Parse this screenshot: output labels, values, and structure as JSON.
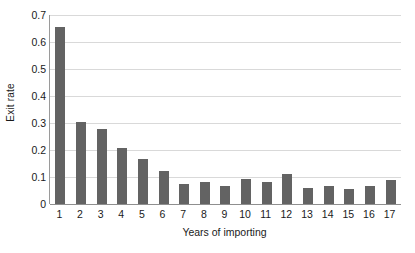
{
  "chart_data": {
    "type": "bar",
    "title": "",
    "xlabel": "Years of importing",
    "ylabel": "Exit rate",
    "categories": [
      "1",
      "2",
      "3",
      "4",
      "5",
      "6",
      "7",
      "8",
      "9",
      "10",
      "11",
      "12",
      "13",
      "14",
      "15",
      "16",
      "17"
    ],
    "values": [
      0.655,
      0.303,
      0.277,
      0.209,
      0.167,
      0.121,
      0.074,
      0.083,
      0.065,
      0.093,
      0.081,
      0.11,
      0.061,
      0.065,
      0.054,
      0.066,
      0.09
    ],
    "ylim": [
      0,
      0.7
    ],
    "yticks": [
      "0",
      "0.1",
      "0.2",
      "0.3",
      "0.4",
      "0.5",
      "0.6",
      "0.7"
    ],
    "ytick_values": [
      0,
      0.1,
      0.2,
      0.3,
      0.4,
      0.5,
      0.6,
      0.7
    ],
    "grid": true,
    "legend": "none",
    "bar_color": "#636363",
    "gridline_color": "#d9d9d9",
    "axis_color": "#8f8f8f",
    "background": "#ffffff"
  }
}
